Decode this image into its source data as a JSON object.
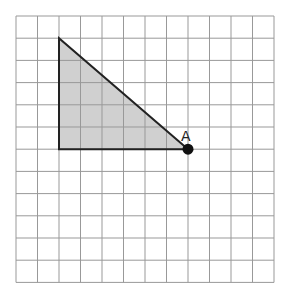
{
  "grid": {
    "cols": 12,
    "rows": 12,
    "x0": 16,
    "y0": 16,
    "cell_w": 21.5,
    "cell_h": 22.2,
    "line_color": "#999999"
  },
  "triangle": {
    "vertices_grid": [
      [
        2,
        1
      ],
      [
        2,
        6
      ],
      [
        8,
        6
      ]
    ],
    "fill": "#d0d0d0",
    "stroke": "#222222"
  },
  "point": {
    "label": "A",
    "grid": [
      8,
      6
    ],
    "color": "#111111"
  }
}
